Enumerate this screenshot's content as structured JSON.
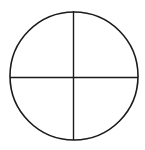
{
  "diagram": {
    "shape": "circle-divided-into-quadrants",
    "stroke_color": "#1a1a1a",
    "background": "#ffffff",
    "circle": {
      "cx": 74,
      "cy": 76,
      "r": 64
    },
    "quadrant_count": 4
  }
}
